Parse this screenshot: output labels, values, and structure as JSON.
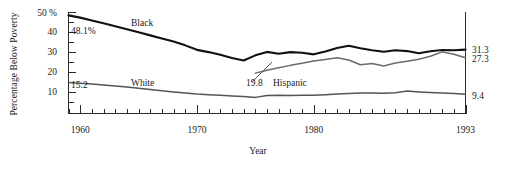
{
  "chart_data": {
    "type": "line",
    "title": "",
    "xlabel": "Year",
    "ylabel": "Percentage Below Poverty",
    "xlim": [
      1959,
      1993
    ],
    "ylim": [
      0,
      50
    ],
    "grid": false,
    "legend": "inline-labels",
    "y_ticks": [
      {
        "value": 50,
        "label": "50 %"
      },
      {
        "value": 40,
        "label": "40"
      },
      {
        "value": 30,
        "label": "30"
      },
      {
        "value": 20,
        "label": "20"
      },
      {
        "value": 10,
        "label": "10"
      }
    ],
    "x_ticks": [
      {
        "value": 1960,
        "label": "1960",
        "major": true
      },
      {
        "value": 1970,
        "label": "1970",
        "major": true
      },
      {
        "value": 1980,
        "label": "1980",
        "major": true
      },
      {
        "value": 1993,
        "label": "1993",
        "major": true
      }
    ],
    "x_minor_interval": 1,
    "series": [
      {
        "name": "Black",
        "label": "Black",
        "color": "#111111",
        "start_label": "48.1%",
        "end_label": "31.3",
        "x": [
          1959,
          1960,
          1961,
          1962,
          1963,
          1964,
          1965,
          1966,
          1967,
          1968,
          1969,
          1970,
          1971,
          1972,
          1973,
          1974,
          1975,
          1976,
          1977,
          1978,
          1979,
          1980,
          1981,
          1982,
          1983,
          1984,
          1985,
          1986,
          1987,
          1988,
          1989,
          1990,
          1991,
          1992,
          1993
        ],
        "values": [
          48.1,
          47.0,
          45.6,
          44.2,
          42.8,
          41.3,
          39.8,
          38.3,
          36.8,
          35.3,
          33.4,
          31.2,
          30.1,
          28.8,
          27.2,
          26.0,
          28.5,
          30.2,
          29.3,
          30.1,
          29.8,
          29.0,
          30.4,
          32.1,
          33.2,
          32.0,
          31.0,
          30.3,
          31.0,
          30.6,
          29.5,
          30.5,
          31.1,
          31.0,
          31.3
        ]
      },
      {
        "name": "White",
        "label": "White",
        "color": "#555555",
        "start_label": "15.2",
        "end_label": "9.4",
        "x": [
          1959,
          1960,
          1961,
          1962,
          1963,
          1964,
          1965,
          1966,
          1967,
          1968,
          1969,
          1970,
          1971,
          1972,
          1973,
          1974,
          1975,
          1976,
          1977,
          1978,
          1979,
          1980,
          1981,
          1982,
          1983,
          1984,
          1985,
          1986,
          1987,
          1988,
          1989,
          1990,
          1991,
          1992,
          1993
        ],
        "values": [
          15.2,
          14.8,
          14.4,
          14.0,
          13.5,
          13.0,
          12.4,
          11.8,
          11.2,
          10.6,
          10.0,
          9.5,
          9.2,
          8.9,
          8.6,
          8.3,
          7.9,
          8.8,
          8.9,
          8.8,
          8.9,
          9.0,
          9.2,
          9.5,
          9.8,
          10.1,
          10.0,
          9.9,
          10.2,
          11.0,
          10.6,
          10.3,
          10.0,
          9.8,
          9.4
        ]
      },
      {
        "name": "Hispanic",
        "label": "Hispanic",
        "color": "#6a6a6a",
        "start_label": "19.8",
        "end_label": "27.3",
        "x": [
          1975,
          1976,
          1977,
          1978,
          1979,
          1980,
          1981,
          1982,
          1983,
          1984,
          1985,
          1986,
          1987,
          1988,
          1989,
          1990,
          1991,
          1992,
          1993
        ],
        "values": [
          19.8,
          21.2,
          22.4,
          23.6,
          24.6,
          25.7,
          26.5,
          27.3,
          26.2,
          23.9,
          24.5,
          23.3,
          24.8,
          25.6,
          26.6,
          28.1,
          30.2,
          29.0,
          27.3
        ]
      }
    ],
    "annotations": [
      {
        "text": "48.1%",
        "series": "Black",
        "position": "start-left"
      },
      {
        "text": "15.2",
        "series": "White",
        "position": "start-left"
      },
      {
        "text": "19.8",
        "series": "Hispanic",
        "position": "below-left-leader"
      },
      {
        "text": "31.3",
        "series": "Black",
        "position": "right-edge"
      },
      {
        "text": "27.3",
        "series": "Hispanic",
        "position": "right-edge"
      },
      {
        "text": "9.4",
        "series": "White",
        "position": "right-edge"
      }
    ]
  }
}
